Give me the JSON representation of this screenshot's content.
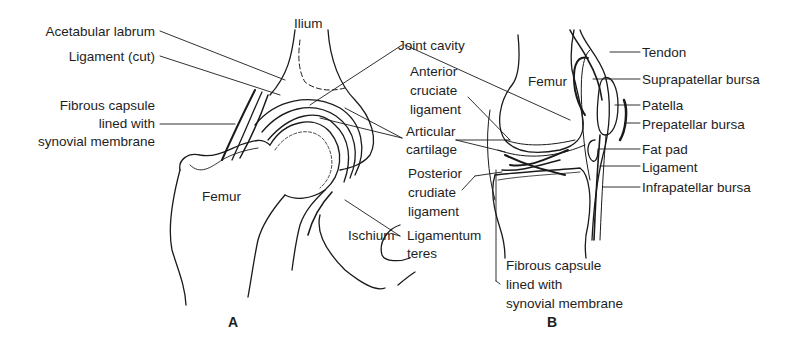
{
  "figure": {
    "panel_a": {
      "letter": "A",
      "labels": {
        "acetabular_labrum": "Acetabular labrum",
        "ligament_cut": "Ligament (cut)",
        "fibrous_capsule_1": "Fibrous capsule",
        "fibrous_capsule_2": "lined with",
        "fibrous_capsule_3": "synovial membrane",
        "ilium": "Ilium",
        "femur": "Femur",
        "ischium": "Ischium",
        "ligamentum_teres_1": "Ligamentum",
        "ligamentum_teres_2": "teres"
      }
    },
    "shared_labels": {
      "joint_cavity": "Joint cavity",
      "articular_cartilage_1": "Articular",
      "articular_cartilage_2": "cartilage"
    },
    "panel_b": {
      "letter": "B",
      "labels": {
        "anterior_cruciate_1": "Anterior",
        "anterior_cruciate_2": "cruciate",
        "anterior_cruciate_3": "ligament",
        "posterior_cruciate_1": "Posterior",
        "posterior_cruciate_2": "crudiate",
        "posterior_cruciate_3": "ligament",
        "femur": "Femur",
        "tendon": "Tendon",
        "suprapatellar_bursa": "Suprapatellar bursa",
        "patella": "Patella",
        "prepatellar_bursa": "Prepatellar bursa",
        "fat_pad": "Fat pad",
        "ligament": "Ligament",
        "infrapatellar_bursa": "Infrapatellar bursa",
        "fibrous_capsule_1": "Fibrous capsule",
        "fibrous_capsule_2": "lined with",
        "fibrous_capsule_3": "synovial membrane"
      }
    }
  }
}
